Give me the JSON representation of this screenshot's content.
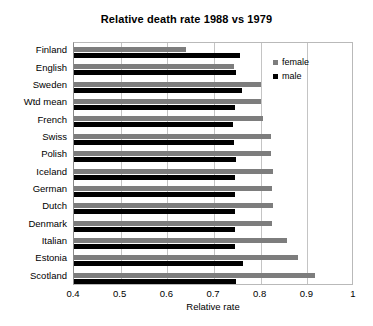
{
  "chart_data": {
    "type": "bar",
    "orientation": "horizontal",
    "title": "Relative death rate 1988 vs 1979",
    "xlabel": "Relative rate",
    "ylabel": "",
    "xlim": [
      0.4,
      1.0
    ],
    "xticks": [
      "0.4",
      "0.5",
      "0.6",
      "0.7",
      "0.8",
      "0.9",
      "1"
    ],
    "xtick_values": [
      0.4,
      0.5,
      0.6,
      0.7,
      0.8,
      0.9,
      1.0
    ],
    "grid": true,
    "legend_position": "top-right",
    "categories": [
      "Finland",
      "English",
      "Sweden",
      "Wtd mean",
      "French",
      "Swiss",
      "Polish",
      "Iceland",
      "German",
      "Dutch",
      "Denmark",
      "Italian",
      "Estonia",
      "Scotland"
    ],
    "series": [
      {
        "name": "female",
        "color": "#7d7d7d",
        "values": [
          0.64,
          0.743,
          0.8,
          0.8,
          0.804,
          0.822,
          0.822,
          0.826,
          0.824,
          0.826,
          0.824,
          0.857,
          0.88,
          0.916
        ]
      },
      {
        "name": "male",
        "color": "#000000",
        "values": [
          0.755,
          0.748,
          0.76,
          0.746,
          0.74,
          0.743,
          0.748,
          0.746,
          0.746,
          0.746,
          0.746,
          0.746,
          0.762,
          0.748
        ]
      }
    ]
  },
  "legend": {
    "items": [
      {
        "label": "female",
        "color": "#7d7d7d"
      },
      {
        "label": "male",
        "color": "#000000"
      }
    ]
  }
}
